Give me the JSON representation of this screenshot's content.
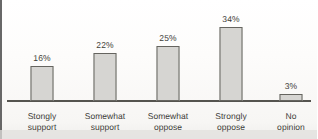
{
  "chart_data": {
    "type": "bar",
    "title": "",
    "subtitle": "",
    "xlabel": "",
    "ylabel": "",
    "grid": false,
    "legend": "none",
    "axis_baseline_visible": true,
    "value_label_suffix": "%",
    "ylim": [
      0,
      40
    ],
    "categories": [
      "Stongly support",
      "Somewhat support",
      "Somewhat oppose",
      "Strongly oppose",
      "No opinion"
    ],
    "category_lines": [
      [
        "Stongly",
        "support"
      ],
      [
        "Somewhat",
        "support"
      ],
      [
        "Somewhat",
        "oppose"
      ],
      [
        "Strongly",
        "oppose"
      ],
      [
        "No",
        "opinion"
      ]
    ],
    "values": [
      16,
      22,
      25,
      34,
      3
    ],
    "value_labels": [
      "16%",
      "22%",
      "25%",
      "34%",
      "3%"
    ],
    "colors": {
      "bar_fill": "#d6d5d2",
      "bar_outline": "#65645f",
      "axis": "#55544f",
      "text": "#3d3c38",
      "background": "#fdfcfa"
    }
  }
}
